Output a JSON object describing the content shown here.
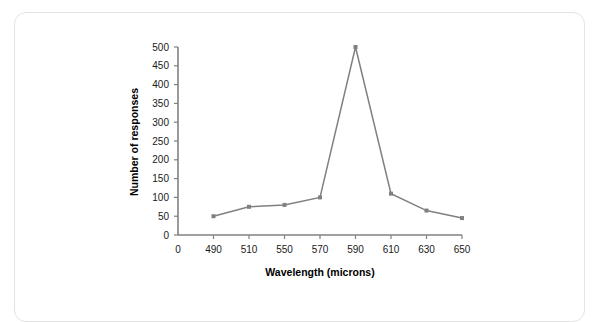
{
  "card": {
    "name": "chart-card"
  },
  "chart_data": {
    "type": "line",
    "title": "",
    "subtitle": "",
    "xlabel": "Wavelength (microns)",
    "ylabel": "Number of responses",
    "x": [
      490,
      510,
      550,
      570,
      590,
      610,
      630,
      650
    ],
    "values": [
      50,
      75,
      80,
      100,
      500,
      110,
      65,
      45
    ],
    "series": [
      {
        "name": "Number of responses",
        "values": [
          50,
          75,
          80,
          100,
          500,
          110,
          65,
          45
        ]
      }
    ],
    "xticks": [
      "0",
      "490",
      "510",
      "550",
      "570",
      "590",
      "610",
      "630",
      "650"
    ],
    "xtick_values": [
      0,
      490,
      510,
      550,
      570,
      590,
      610,
      630,
      650
    ],
    "yticks": [
      "0",
      "50",
      "100",
      "150",
      "200",
      "250",
      "300",
      "350",
      "400",
      "450",
      "500"
    ],
    "ytick_values": [
      0,
      50,
      100,
      150,
      200,
      250,
      300,
      350,
      400,
      450,
      500
    ],
    "ylim": [
      0,
      500
    ],
    "grid": false,
    "legend": false,
    "legend_position": "none",
    "line_color": "#808080",
    "marker_color": "#808080",
    "marker": "square",
    "axis_color": "#808080",
    "text_color": "#000000",
    "background_color": "#ffffff"
  }
}
